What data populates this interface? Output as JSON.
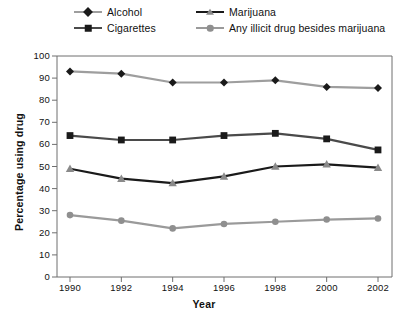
{
  "chart_data": {
    "type": "line",
    "title": "",
    "xlabel": "Year",
    "ylabel": "Percentage using drug",
    "categories": [
      "1990",
      "1992",
      "1994",
      "1996",
      "1998",
      "2000",
      "2002"
    ],
    "x": [
      1990,
      1992,
      1994,
      1996,
      1998,
      2000,
      2002
    ],
    "xlim": [
      1989,
      2003
    ],
    "ylim": [
      0,
      100
    ],
    "yticks": [
      "0",
      "10",
      "20",
      "30",
      "40",
      "50",
      "60",
      "70",
      "80",
      "90",
      "100"
    ],
    "ytick_values": [
      0,
      10,
      20,
      30,
      40,
      50,
      60,
      70,
      80,
      90,
      100
    ],
    "grid": false,
    "legend_position": "top",
    "series": [
      {
        "name": "Alcohol",
        "marker": "diamond",
        "line_color": "#9e9e9e",
        "marker_color": "#1a1a1a",
        "values": [
          93,
          92,
          88,
          88,
          89,
          86,
          85.5
        ]
      },
      {
        "name": "Cigarettes",
        "marker": "square",
        "line_color": "#4a4a4a",
        "marker_color": "#1a1a1a",
        "values": [
          64,
          62,
          62,
          64,
          65,
          62.5,
          57.5
        ]
      },
      {
        "name": "Marijuana",
        "marker": "triangle",
        "line_color": "#1a1a1a",
        "marker_color": "#8a8a8a",
        "values": [
          49,
          44.5,
          42.5,
          45.5,
          50,
          51,
          49.5
        ]
      },
      {
        "name": "Any illicit drug besides marijuana",
        "marker": "circle",
        "line_color": "#9a9a9a",
        "marker_color": "#8f8f8f",
        "values": [
          28,
          25.5,
          22,
          24,
          25,
          26,
          26.5
        ]
      }
    ]
  },
  "legend": {
    "entries": [
      {
        "label": "Alcohol",
        "row": 0,
        "col": 0,
        "marker": "diamond",
        "line_color": "#9e9e9e",
        "marker_color": "#1a1a1a"
      },
      {
        "label": "Marijuana",
        "row": 0,
        "col": 1,
        "marker": "triangle",
        "line_color": "#1a1a1a",
        "marker_color": "#8a8a8a"
      },
      {
        "label": "Cigarettes",
        "row": 1,
        "col": 0,
        "marker": "square",
        "line_color": "#4a4a4a",
        "marker_color": "#1a1a1a"
      },
      {
        "label": "Any illicit drug besides marijuana",
        "row": 1,
        "col": 1,
        "marker": "circle",
        "line_color": "#9a9a9a",
        "marker_color": "#8f8f8f"
      }
    ]
  },
  "axes": {
    "frame_color": "#6f6f6f",
    "background": "#ffffff"
  }
}
